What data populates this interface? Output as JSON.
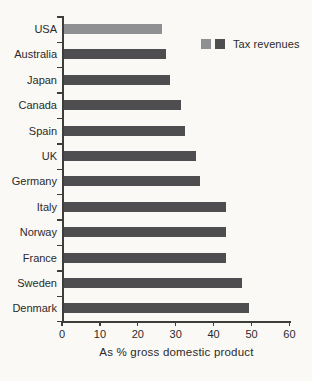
{
  "chart_data": {
    "type": "bar",
    "orientation": "horizontal",
    "categories": [
      "USA",
      "Australia",
      "Japan",
      "Canada",
      "Spain",
      "UK",
      "Germany",
      "Italy",
      "Norway",
      "France",
      "Sweden",
      "Denmark"
    ],
    "values": [
      26,
      27,
      28,
      31,
      32,
      35,
      36,
      43,
      43,
      43,
      47,
      49
    ],
    "series_name": "Tax revenues",
    "bar_color_keys": [
      "light",
      "dark",
      "dark",
      "dark",
      "dark",
      "dark",
      "dark",
      "dark",
      "dark",
      "dark",
      "dark",
      "dark"
    ],
    "colors": {
      "light": "#8f9092",
      "dark": "#4e4e50",
      "axis": "#3d3d3d",
      "text": "#2a2a2a",
      "background": "#faf9f5"
    },
    "xlabel": "As % gross domestic product",
    "xlim": [
      0,
      60
    ],
    "xticks": [
      0,
      10,
      20,
      30,
      40,
      50,
      60
    ],
    "grid": false,
    "legend": {
      "label": "Tax revenues",
      "swatches": [
        "#8f9092",
        "#4e4e50"
      ],
      "position": "top-right"
    }
  }
}
